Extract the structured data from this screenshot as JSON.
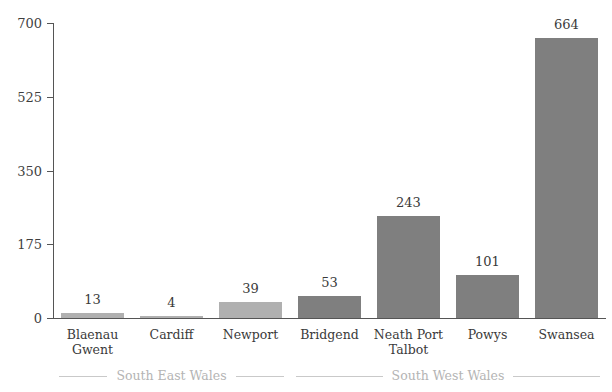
{
  "chart_data": {
    "type": "bar",
    "title": "",
    "xlabel": "",
    "ylabel": "",
    "categories": [
      "Blaenau Gwent",
      "Cardiff",
      "Newport",
      "Bridgend",
      "Neath Port Talbot",
      "Powys",
      "Swansea"
    ],
    "category_lines": [
      [
        "Blaenau",
        "Gwent"
      ],
      [
        "Cardiff"
      ],
      [
        "Newport"
      ],
      [
        "Bridgend"
      ],
      [
        "Neath Port",
        "Talbot"
      ],
      [
        "Powys"
      ],
      [
        "Swansea"
      ]
    ],
    "values": [
      13,
      4,
      39,
      53,
      243,
      101,
      664
    ],
    "value_labels": [
      "13",
      "4",
      "39",
      "53",
      "243",
      "101",
      "664"
    ],
    "ylim": [
      0,
      700
    ],
    "yticks": [
      0,
      175,
      350,
      525,
      700
    ],
    "ytick_labels": [
      "0",
      "175",
      "350",
      "525",
      "700"
    ],
    "grid": false,
    "legend_position": "below-axis",
    "groups": [
      {
        "label": "South East Wales",
        "categories": [
          "Blaenau Gwent",
          "Cardiff",
          "Newport"
        ],
        "color": "#b0b0b0"
      },
      {
        "label": "South West Wales",
        "categories": [
          "Bridgend",
          "Neath Port Talbot",
          "Powys",
          "Swansea"
        ],
        "color": "#7f7f7f"
      }
    ],
    "bar_group_index": [
      0,
      0,
      0,
      1,
      1,
      1,
      1
    ],
    "colors": {
      "south_east_wales": "#b0b0b0",
      "south_west_wales": "#7f7f7f",
      "axis": "#555555",
      "text": "#3a3a3a",
      "group_label": "#b4b4b4",
      "rule": "#c9c9c9"
    }
  }
}
